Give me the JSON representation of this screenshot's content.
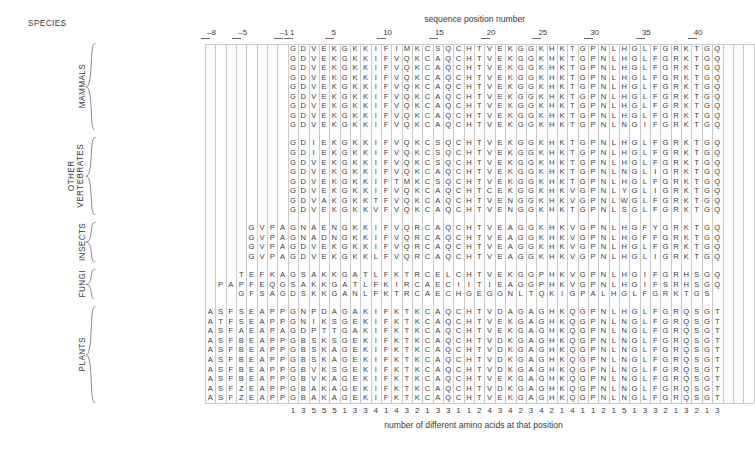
{
  "figure": {
    "species_header": "SPECIES",
    "top_caption": "sequence position number",
    "bottom_caption": "number of different amino acids at that position"
  },
  "axis": {
    "ticks": [
      {
        "label": "–8",
        "pos": -8
      },
      {
        "label": "–5",
        "pos": -5
      },
      {
        "label": "–1",
        "pos": -1
      },
      {
        "label": "1",
        "pos": 1
      },
      {
        "label": "5",
        "pos": 5
      },
      {
        "label": "10",
        "pos": 10
      },
      {
        "label": "15",
        "pos": 15
      },
      {
        "label": "20",
        "pos": 20
      },
      {
        "label": "25",
        "pos": 25
      },
      {
        "label": "30",
        "pos": 30
      },
      {
        "label": "35",
        "pos": 35
      },
      {
        "label": "40",
        "pos": 40
      }
    ],
    "first_column": -8,
    "last_column": 44
  },
  "groups": [
    {
      "name": "MAMMALS",
      "lines": [
        "MAMMALS"
      ],
      "start_row": 0,
      "end_row": 8
    },
    {
      "name": "OTHER VERTEBRATES",
      "lines": [
        "OTHER",
        "VERTEBRATES"
      ],
      "start_row": 9,
      "end_row": 16
    },
    {
      "name": "INSECTS",
      "lines": [
        "INSECTS"
      ],
      "start_row": 17,
      "end_row": 20
    },
    {
      "name": "FUNGI",
      "lines": [
        "FUNGI"
      ],
      "start_row": 21,
      "end_row": 23
    },
    {
      "name": "PLANTS",
      "lines": [
        "PLANTS"
      ],
      "start_row": 24,
      "end_row": 33
    }
  ],
  "rows": [
    {
      "species": "human, chimpanzee",
      "italic": false,
      "group": "MAMMALS",
      "offset": 1,
      "sequence": "GDVEKGKKIFIMKCSQCHTVEKGGKHKTGPNLHGLFGRKTGQ"
    },
    {
      "species": "rhesus monkey",
      "italic": false,
      "group": "MAMMALS",
      "offset": 1,
      "sequence": "GDVEKGKKIFVQKCAQCHTVEKGGKHKTGPNLHGLFGRKTGQ"
    },
    {
      "species": "horse",
      "italic": false,
      "group": "MAMMALS",
      "offset": 1,
      "sequence": "GDVEKGKKIFVQKCAQCHTVEKGGKHKTGPNLHGLFGRKTGQ"
    },
    {
      "species": "donkey",
      "italic": false,
      "group": "MAMMALS",
      "offset": 1,
      "sequence": "GDVEKGKKIFVQKCAQCHTVEKGGKHKTGPNLHGLFGRKTGQ"
    },
    {
      "species": "cow, pig, sheep",
      "italic": false,
      "group": "MAMMALS",
      "offset": 1,
      "sequence": "GDVEKGKKIFVQKCAQCHTVEKGGKHKTGPNLHGLFGRKTGQ"
    },
    {
      "species": "dog",
      "italic": false,
      "group": "MAMMALS",
      "offset": 1,
      "sequence": "GDVEKGKKIFVQKCAQCHTVEKGGKHKTGPNLHGLFGRKTGQ"
    },
    {
      "species": "rabbit",
      "italic": false,
      "group": "MAMMALS",
      "offset": 1,
      "sequence": "GDVEKGKKIFVQKCAQCHTVEKGGKHKTGPNLHGLFGRKTGQ"
    },
    {
      "species": "california gray whale",
      "italic": false,
      "group": "MAMMALS",
      "offset": 1,
      "sequence": "GDVEKGKKIFVQKCAQCHTVEKGGKHKTGPNLHGLFGRKTGQ"
    },
    {
      "species": "great gray kangaroo",
      "italic": false,
      "group": "MAMMALS",
      "offset": 1,
      "sequence": "GDVEKGKKIFVQKCAQCHTVEKGGKHKTGPNLNGIFGRKTGQ"
    },
    {
      "species": "chicken, turkey",
      "italic": false,
      "group": "OTHER VERTEBRATES",
      "offset": 1,
      "sequence": "GDIEKGKKIFVQKCSQCHTVEKGGKHKTGPNLHGLFGRKTGQ"
    },
    {
      "species": "pigeon",
      "italic": false,
      "group": "OTHER VERTEBRATES",
      "offset": 1,
      "sequence": "GDIEKGKKIFVQKCSQCHTVEKGGKHKTGPNLHGLFGRKTGQ"
    },
    {
      "species": "pekin duck",
      "italic": false,
      "group": "OTHER VERTEBRATES",
      "offset": 1,
      "sequence": "GDVEKGKKIFVQKCSQCHTVEKGGKHKTGPNLHGLFGRKTGQ"
    },
    {
      "species": "snapping turtle",
      "italic": false,
      "group": "OTHER VERTEBRATES",
      "offset": 1,
      "sequence": "GDVEKGKKIFVQKCAQCHTVEKGGKHKTGPNLNGLIGRKTGQ"
    },
    {
      "species": "rattlesnake",
      "italic": false,
      "group": "OTHER VERTEBRATES",
      "offset": 1,
      "sequence": "GDVEKGKKIFTMKCSQCHTVEKGGKHKTGPNLHGLFGRKTGQ"
    },
    {
      "species": "bullfrog",
      "italic": false,
      "group": "OTHER VERTEBRATES",
      "offset": 1,
      "sequence": "GDVEKGKKIFVQKCAQCHTCEKGGKHKVGPNLYGLIGRKTGQ"
    },
    {
      "species": "tuna",
      "italic": false,
      "group": "OTHER VERTEBRATES",
      "offset": 1,
      "sequence": "GDVAKGKKTFVQKCAQCHTVENGGKHKVGPNLWGLFGRKTGQ"
    },
    {
      "species": "dogfish",
      "italic": false,
      "group": "OTHER VERTEBRATES",
      "offset": 1,
      "sequence": "GDVEKGKKVFVQKCAQCHTVENGGKHKTGPNLSGLFGRKTGQ"
    },
    {
      "species": "Samia cynthia (a moth)",
      "italic": true,
      "group": "INSECTS",
      "offset": -4,
      "sequence": "GVPAGNAENGKKIFVQRCAQCHTVEAGGKHKVGPNLHGFYGRKTGQ"
    },
    {
      "species": "tobacco hornworm moth",
      "italic": false,
      "group": "INSECTS",
      "offset": -4,
      "sequence": "GVPAGNADNGKKIFVQRCAQCHTVEAGGKHKVGPNLHGFFGRKTGQ"
    },
    {
      "species": "screwworm fly",
      "italic": false,
      "group": "INSECTS",
      "offset": -4,
      "sequence": "GVPAGDVEKGKKIFVQRCAQCHTVEAGGKHKVGPNLHGLFGRKTGQ"
    },
    {
      "species": "Drosophila melanogaster",
      "italic": true,
      "group": "INSECTS",
      "offset": -4,
      "sequence": "GVPAGDVEKGKKLFVQRCAQCHTVEAGGKHKVGPNLHGLIGRKTGQ"
    },
    {
      "species": "Saccharomyces cerevisiae",
      "italic": true,
      "group": "FUNGI",
      "offset": -5,
      "sequence": "TEFKAGSAKKGATLFKTRCELCHTVEKGGPHKVGPNLHGIFGRHSGQ"
    },
    {
      "species": "Candida krusei",
      "italic": true,
      "group": "FUNGI",
      "offset": -7,
      "sequence": "PAPFEQGSAKKGATLFKIRCAECIITIEAGGPHKVGPNLHGIFSRHSGQ"
    },
    {
      "species": "Neurospora crassa",
      "italic": true,
      "group": "FUNGI",
      "offset": -5,
      "sequence": "GFSAGDSKKGANLFKTRCAECHGEGGNLTQKIGPALHGLFGRKTGS"
    },
    {
      "species": "wheat",
      "italic": false,
      "group": "PLANTS",
      "offset": -8,
      "sequence": "ASFSEAPPGNPDAGAKIFKTKCAQCHTVDAGAGHKQGPNLHGLFGRQSGT"
    },
    {
      "species": "buckwheat",
      "italic": false,
      "group": "PLANTS",
      "offset": -8,
      "sequence": "ATFSEAPPGNIKSGEKIFKTKCAQCHTVEKGAGHKQGPNLNGLFGRQSGT"
    },
    {
      "species": "sunflower",
      "italic": false,
      "group": "PLANTS",
      "offset": -8,
      "sequence": "ASFAEAPAGDPTTGAKIFKTKCAQCHTVEKGAGHKQGPNLNGLFGRQSGT"
    },
    {
      "species": "mung bean",
      "italic": false,
      "group": "PLANTS",
      "offset": -8,
      "sequence": "ASFBEAPPGBSKSGEKIFKTKCAQCHTVDKGAGHKQGPNLNGLFGRQSGT"
    },
    {
      "species": "cauliflower",
      "italic": false,
      "group": "PLANTS",
      "offset": -8,
      "sequence": "ASFBEAPPGBSKAGEKIFKTKCAQCHTVDKGAGHKQGPNLNGLFGRQSGT"
    },
    {
      "species": "pumpkin",
      "italic": false,
      "group": "PLANTS",
      "offset": -8,
      "sequence": "ASFBEAPPGBSKAGEKIFKTKCAQCHTVDKGAGHKQGPNLNGLFGRQSGT"
    },
    {
      "species": "sesame",
      "italic": false,
      "group": "PLANTS",
      "offset": -8,
      "sequence": "ASFBEAPPGBVKSGEKIFKTKCAQCHTVDKGAGHKQGPNLNGLFGRQSGT"
    },
    {
      "species": "castor bean",
      "italic": false,
      "group": "PLANTS",
      "offset": -8,
      "sequence": "ASFBEAPPGBVKAGEKIFKTKCAQCHTVEKGAGHKQGPNLNGLFGRQSGT"
    },
    {
      "species": "cotton",
      "italic": false,
      "group": "PLANTS",
      "offset": -8,
      "sequence": "ASFZEAPPGBAKAGEKIFKTKCAQCHTVDKGAGHKQGPNLNGLFGRQSGT"
    },
    {
      "species": "Abutilon",
      "italic": true,
      "group": "PLANTS",
      "offset": -8,
      "sequence": "ASFZEAPPGBAKAGEKIFKTKCAQCHTVEKGAGHKQGPNLNGLFGRQSGT"
    }
  ],
  "variability": {
    "start_position": 1,
    "counts": [
      1,
      3,
      5,
      5,
      5,
      1,
      3,
      3,
      4,
      1,
      4,
      3,
      2,
      1,
      3,
      3,
      1,
      1,
      2,
      4,
      3,
      4,
      2,
      3,
      4,
      2,
      1,
      4,
      1,
      1,
      2,
      1,
      5,
      1,
      3,
      3,
      2,
      1,
      3,
      2,
      1,
      3
    ]
  },
  "colors": {
    "text": "#3a3a3a",
    "grid_line": "#c9c9c9",
    "tick": "#6a6a6a",
    "background": "#ffffff"
  }
}
